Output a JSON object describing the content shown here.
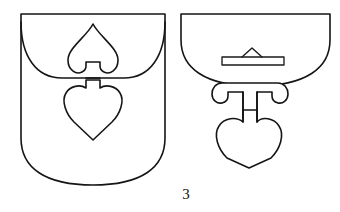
{
  "plate": {
    "caption": "3",
    "background_color": "#ffffff",
    "ink_color": "#151515",
    "figure_count": 2
  },
  "figures": [
    {
      "id": "left-figure",
      "name": "shield-shaped-mount-front-view",
      "label": "",
      "parts": [
        {
          "name": "shield-body-outline",
          "description": "shield / pouch shaped plate, square shoulders, rounded base"
        },
        {
          "name": "flap-curve",
          "description": "curved flap edge crossing the plate horizontally"
        },
        {
          "name": "upper-spade-motif",
          "description": "inverted heart / spade-shaped openwork above the flap with a rectangular notch at its base"
        },
        {
          "name": "lower-heart-motif",
          "description": "heart-shaped openwork below the flap with a rectangular tab at its top"
        }
      ]
    },
    {
      "id": "right-figure",
      "name": "bowl-shaped-mount-with-pendant",
      "label": "",
      "parts": [
        {
          "name": "bowl-body-outline",
          "description": "half-round bowl with straight top edge"
        },
        {
          "name": "horizontal-bar",
          "description": "narrow rectangular bar with a triangular peak rising at its centre"
        },
        {
          "name": "twin-lobe-bracket",
          "description": "two round lobes flanking a central stem below the bowl"
        },
        {
          "name": "pendant-heart",
          "description": "heart-shaped pendant hanging from the stem"
        }
      ]
    }
  ]
}
